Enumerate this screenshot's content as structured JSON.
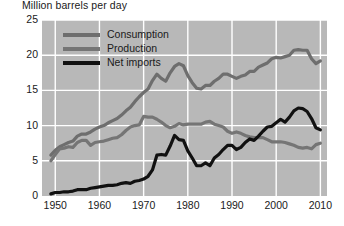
{
  "chart_data": {
    "type": "line",
    "title": "Million barrels per day",
    "xlabel": "",
    "ylabel": "Million barrels per day",
    "xlim": [
      1947,
      2011.5
    ],
    "ylim": [
      0,
      25
    ],
    "yticks": [
      0,
      5,
      10,
      15,
      20,
      25
    ],
    "xticks": [
      1950,
      1960,
      1970,
      1980,
      1990,
      2000,
      2010
    ],
    "grid": true,
    "grid_color": "#ffffff",
    "plot_background": "#b8b8b8",
    "legend_position": "top-left",
    "series": [
      {
        "name": "Consumption",
        "color": "#6e6e6e",
        "x": [
          1949,
          1950,
          1951,
          1952,
          1953,
          1954,
          1955,
          1956,
          1957,
          1958,
          1959,
          1960,
          1961,
          1962,
          1963,
          1964,
          1965,
          1966,
          1967,
          1968,
          1969,
          1970,
          1971,
          1972,
          1973,
          1974,
          1975,
          1976,
          1977,
          1978,
          1979,
          1980,
          1981,
          1982,
          1983,
          1984,
          1985,
          1986,
          1987,
          1988,
          1989,
          1990,
          1991,
          1992,
          1993,
          1994,
          1995,
          1996,
          1997,
          1998,
          1999,
          2000,
          2001,
          2002,
          2003,
          2004,
          2005,
          2006,
          2007,
          2008,
          2009,
          2010
        ],
        "values": [
          5.8,
          6.5,
          7.0,
          7.3,
          7.6,
          7.8,
          8.5,
          8.8,
          8.8,
          9.1,
          9.5,
          9.8,
          10.0,
          10.4,
          10.7,
          11.0,
          11.5,
          12.1,
          12.6,
          13.4,
          14.1,
          14.7,
          15.2,
          16.4,
          17.3,
          16.7,
          16.3,
          17.5,
          18.4,
          18.8,
          18.5,
          17.1,
          16.1,
          15.3,
          15.2,
          15.7,
          15.7,
          16.3,
          16.7,
          17.3,
          17.3,
          17.0,
          16.7,
          17.0,
          17.2,
          17.7,
          17.7,
          18.3,
          18.6,
          18.9,
          19.5,
          19.7,
          19.6,
          19.8,
          20.0,
          20.7,
          20.8,
          20.7,
          20.7,
          19.5,
          18.8,
          19.2
        ]
      },
      {
        "name": "Production",
        "color": "#757575",
        "x": [
          1949,
          1950,
          1951,
          1952,
          1953,
          1954,
          1955,
          1956,
          1957,
          1958,
          1959,
          1960,
          1961,
          1962,
          1963,
          1964,
          1965,
          1966,
          1967,
          1968,
          1969,
          1970,
          1971,
          1972,
          1973,
          1974,
          1975,
          1976,
          1977,
          1978,
          1979,
          1980,
          1981,
          1982,
          1983,
          1984,
          1985,
          1986,
          1987,
          1988,
          1989,
          1990,
          1991,
          1992,
          1993,
          1994,
          1995,
          1996,
          1997,
          1998,
          1999,
          2000,
          2001,
          2002,
          2003,
          2004,
          2005,
          2006,
          2007,
          2008,
          2009,
          2010
        ],
        "values": [
          5.0,
          5.9,
          6.7,
          6.8,
          7.0,
          6.9,
          7.6,
          7.9,
          7.9,
          7.2,
          7.6,
          7.7,
          7.8,
          8.0,
          8.2,
          8.3,
          8.7,
          9.3,
          9.8,
          10.0,
          10.1,
          11.3,
          11.2,
          11.2,
          10.9,
          10.5,
          10.0,
          9.7,
          9.9,
          10.3,
          10.1,
          10.2,
          10.2,
          10.2,
          10.2,
          10.5,
          10.6,
          10.2,
          10.0,
          9.8,
          9.2,
          8.9,
          9.1,
          8.9,
          8.6,
          8.4,
          8.3,
          8.3,
          8.3,
          8.0,
          7.7,
          7.7,
          7.7,
          7.6,
          7.4,
          7.2,
          6.9,
          6.8,
          6.9,
          6.7,
          7.3,
          7.5
        ]
      },
      {
        "name": "Net imports",
        "color": "#111111",
        "x": [
          1949,
          1950,
          1951,
          1952,
          1953,
          1954,
          1955,
          1956,
          1957,
          1958,
          1959,
          1960,
          1961,
          1962,
          1963,
          1964,
          1965,
          1966,
          1967,
          1968,
          1969,
          1970,
          1971,
          1972,
          1973,
          1974,
          1975,
          1976,
          1977,
          1978,
          1979,
          1980,
          1981,
          1982,
          1983,
          1984,
          1985,
          1986,
          1987,
          1988,
          1989,
          1990,
          1991,
          1992,
          1993,
          1994,
          1995,
          1996,
          1997,
          1998,
          1999,
          2000,
          2001,
          2002,
          2003,
          2004,
          2005,
          2006,
          2007,
          2008,
          2009,
          2010
        ],
        "values": [
          0.3,
          0.5,
          0.5,
          0.6,
          0.6,
          0.7,
          0.9,
          0.9,
          0.9,
          1.1,
          1.2,
          1.3,
          1.4,
          1.5,
          1.5,
          1.6,
          1.8,
          1.9,
          1.8,
          2.1,
          2.2,
          2.4,
          2.8,
          3.7,
          5.8,
          5.9,
          5.8,
          7.1,
          8.6,
          8.0,
          7.9,
          6.4,
          5.4,
          4.3,
          4.3,
          4.7,
          4.3,
          5.4,
          5.9,
          6.6,
          7.2,
          7.2,
          6.6,
          6.9,
          7.6,
          8.1,
          7.9,
          8.5,
          9.2,
          9.8,
          9.9,
          10.4,
          10.9,
          10.5,
          11.2,
          12.1,
          12.5,
          12.4,
          12.0,
          11.0,
          9.7,
          9.4
        ]
      }
    ]
  },
  "legend": {
    "items": [
      {
        "label": "Consumption",
        "color": "#6e6e6e"
      },
      {
        "label": "Production",
        "color": "#757575"
      },
      {
        "label": "Net imports",
        "color": "#111111"
      }
    ]
  },
  "axes": {
    "y_tick_labels": [
      "25",
      "20",
      "15",
      "10",
      "5",
      "0"
    ],
    "x_tick_labels": [
      "1950",
      "1960",
      "1970",
      "1980",
      "1990",
      "2000",
      "2010"
    ]
  }
}
